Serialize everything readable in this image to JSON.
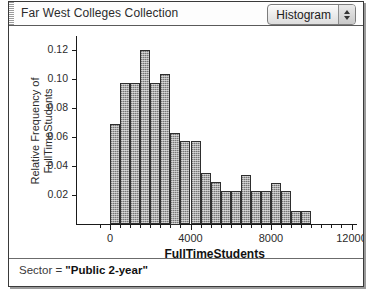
{
  "window": {
    "collection_title": "Far West Colleges Collection"
  },
  "toolbar": {
    "plot_type_label": "Histogram",
    "stepper_up_icon": "triangle-up-icon",
    "stepper_down_icon": "triangle-down-icon"
  },
  "status": {
    "text": "Sector =  \"Public  2-year\"",
    "prefix": "Sector = ",
    "value": "\"Public  2-year\""
  },
  "chart_data": {
    "type": "bar",
    "title": "",
    "xlabel": "FullTimeStudents",
    "ylabel": "Relative Frequency of FullTimeStudents",
    "xlim": [
      -700,
      13200
    ],
    "ylim": [
      0,
      0.148
    ],
    "xticks": [
      0,
      4000,
      8000,
      12000
    ],
    "xtick_labels": [
      "0",
      "4000",
      "8000",
      "12000"
    ],
    "x_minor_step": 500,
    "yticks": [
      0.02,
      0.04,
      0.06,
      0.08,
      0.1,
      0.12,
      0.14
    ],
    "ytick_labels": [
      "0.02",
      "0.04",
      "0.06",
      "0.08",
      "0.10",
      "0.12",
      "0.14"
    ],
    "grid": false,
    "legend": "none",
    "bin_width": 500,
    "bin_starts": [
      0,
      500,
      1000,
      1500,
      2000,
      2500,
      3000,
      3500,
      4000,
      4500,
      5000,
      5500,
      6000,
      6500,
      7000,
      7500,
      8000,
      8500,
      9000,
      9500
    ],
    "values": [
      0.069,
      0.097,
      0.097,
      0.12,
      0.097,
      0.103,
      0.063,
      0.057,
      0.057,
      0.035,
      0.029,
      0.023,
      0.023,
      0.034,
      0.023,
      0.023,
      0.028,
      0.023,
      0.009,
      0.009
    ]
  }
}
